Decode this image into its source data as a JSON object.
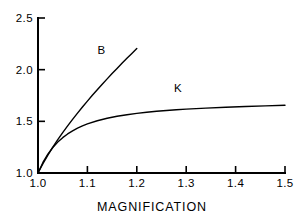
{
  "chart_data": {
    "type": "line",
    "title": "",
    "subtitle": "",
    "xlabel": "MAGNIFICATION",
    "ylabel": "",
    "xlim": [
      1.0,
      1.5
    ],
    "ylim": [
      1.0,
      2.5
    ],
    "xticks": [
      1.0,
      1.1,
      1.2,
      1.3,
      1.4,
      1.5
    ],
    "xtick_labels": [
      "1.0",
      "1.1",
      "1.2",
      "1.3",
      "1.4",
      "1.5"
    ],
    "yticks": [
      1.0,
      1.5,
      2.0,
      2.5
    ],
    "ytick_labels": [
      "1.0",
      "1.5",
      "2.0",
      "2.5"
    ],
    "grid": false,
    "legend": "inline-annotations",
    "line_color": "#000000",
    "axis_color": "#000000",
    "background_color": "#ffffff",
    "series": [
      {
        "name": "B",
        "label": "B",
        "label_x": 1.128,
        "label_y": 2.155,
        "x": [
          1.0,
          1.01,
          1.02,
          1.03,
          1.04,
          1.05,
          1.06,
          1.07,
          1.08,
          1.09,
          1.1,
          1.11,
          1.12,
          1.13,
          1.14,
          1.15,
          1.16,
          1.17,
          1.18,
          1.19,
          1.2
        ],
        "values": [
          1.0,
          1.09,
          1.173,
          1.25,
          1.322,
          1.391,
          1.456,
          1.519,
          1.58,
          1.639,
          1.696,
          1.752,
          1.806,
          1.859,
          1.911,
          1.962,
          2.012,
          2.061,
          2.11,
          2.157,
          2.205
        ]
      },
      {
        "name": "K",
        "label": "K",
        "label_x": 1.283,
        "label_y": 1.783,
        "x": [
          1.0,
          1.01,
          1.02,
          1.03,
          1.04,
          1.05,
          1.06,
          1.07,
          1.08,
          1.09,
          1.1,
          1.12,
          1.14,
          1.16,
          1.18,
          1.2,
          1.22,
          1.24,
          1.26,
          1.28,
          1.3,
          1.34,
          1.38,
          1.42,
          1.46,
          1.5
        ],
        "values": [
          1.0,
          1.102,
          1.182,
          1.247,
          1.299,
          1.342,
          1.378,
          1.408,
          1.434,
          1.456,
          1.475,
          1.506,
          1.53,
          1.549,
          1.564,
          1.577,
          1.588,
          1.597,
          1.605,
          1.612,
          1.618,
          1.628,
          1.636,
          1.643,
          1.65,
          1.656
        ]
      }
    ]
  }
}
